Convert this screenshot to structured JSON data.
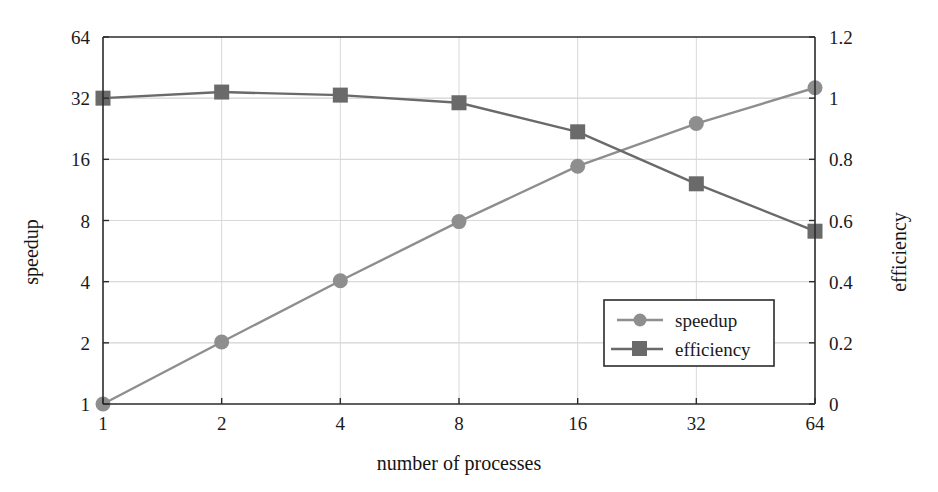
{
  "figure": {
    "background_color": "#ffffff",
    "frame_color": "#2b2b2b",
    "grid_color": "#d8d8d8"
  },
  "chart_data": {
    "type": "line",
    "title": "",
    "subtitle": "",
    "xlabel": "number of processes",
    "ylabel": "speedup",
    "y2label": "efficiency",
    "x": [
      1,
      2,
      4,
      8,
      16,
      32,
      64
    ],
    "xscale": "log2",
    "xlim": [
      1,
      64
    ],
    "xticklabels": [
      "1",
      "2",
      "4",
      "8",
      "16",
      "32",
      "64"
    ],
    "yscale": "log2",
    "ylim": [
      1,
      64
    ],
    "yticklabels": [
      "1",
      "2",
      "4",
      "8",
      "16",
      "32",
      "64"
    ],
    "yticks": [
      1,
      2,
      4,
      8,
      16,
      32,
      64
    ],
    "y2lim": [
      0,
      1.2
    ],
    "y2ticks": [
      0,
      0.2,
      0.4,
      0.6,
      0.8,
      1,
      1.2
    ],
    "y2ticklabels": [
      "0",
      "0.2",
      "0.4",
      "0.6",
      "0.8",
      "1",
      "1.2"
    ],
    "grid": true,
    "legend_position": "lower-right-inside",
    "series": [
      {
        "name": "speedup",
        "axis": "left",
        "marker": "circle",
        "color": "#8e8e8e",
        "values": [
          1,
          2.02,
          4.04,
          7.9,
          14.8,
          24.0,
          36.0
        ]
      },
      {
        "name": "efficiency",
        "axis": "right",
        "marker": "square",
        "color": "#6a6a6a",
        "values": [
          1.0,
          1.02,
          1.01,
          0.985,
          0.89,
          0.72,
          0.565
        ]
      }
    ]
  },
  "legend": {
    "entries": [
      {
        "label": "speedup",
        "marker": "circle-marker",
        "color": "#8e8e8e"
      },
      {
        "label": "efficiency",
        "marker": "square-marker",
        "color": "#6a6a6a"
      }
    ]
  },
  "axes": {
    "x_title": "number of processes",
    "y_left_title": "speedup",
    "y_right_title": "efficiency",
    "x_ticks": [
      "1",
      "2",
      "4",
      "8",
      "16",
      "32",
      "64"
    ],
    "y_left_ticks": [
      "64",
      "32",
      "16",
      "8",
      "4",
      "2",
      "1"
    ],
    "y_right_ticks": [
      "1.2",
      "1",
      "0.8",
      "0.6",
      "0.4",
      "0.2",
      "0"
    ]
  }
}
